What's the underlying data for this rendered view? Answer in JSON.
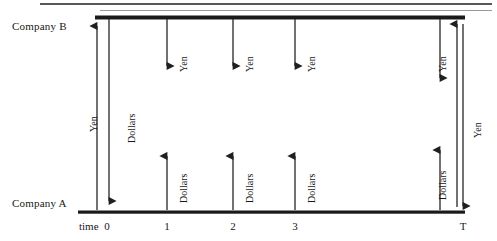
{
  "diagram": {
    "type": "swap-cash-flow-timeline",
    "companies": {
      "top_label": "Company B",
      "bottom_label": "Company A"
    },
    "axis": {
      "time_word": "time",
      "ticks": [
        "0",
        "1",
        "2",
        "3",
        "T"
      ]
    },
    "currencies": {
      "yen": "Yen",
      "dollars": "Dollars"
    },
    "flows": [
      {
        "time": "0",
        "label": "Yen",
        "direction": "up",
        "note": "principal exchange at inception, A to B"
      },
      {
        "time": "0",
        "label": "Dollars",
        "direction": "down",
        "note": "principal exchange at inception, B to A"
      },
      {
        "time": "1",
        "label": "Yen",
        "direction": "down",
        "note": "interest payment B to A"
      },
      {
        "time": "1",
        "label": "Dollars",
        "direction": "up",
        "note": "interest payment A to B"
      },
      {
        "time": "2",
        "label": "Yen",
        "direction": "down",
        "note": "interest payment B to A"
      },
      {
        "time": "2",
        "label": "Dollars",
        "direction": "up",
        "note": "interest payment A to B"
      },
      {
        "time": "3",
        "label": "Yen",
        "direction": "down",
        "note": "interest payment B to A"
      },
      {
        "time": "3",
        "label": "Dollars",
        "direction": "up",
        "note": "interest payment A to B"
      },
      {
        "time": "T",
        "label": "Yen",
        "direction": "down",
        "note": "final interest payment B to A"
      },
      {
        "time": "T",
        "label": "Dollars",
        "direction": "up",
        "note": "final interest payment A to B"
      },
      {
        "time": "T",
        "label": "Yen",
        "direction": "both",
        "note": "principal re-exchange at maturity"
      }
    ],
    "colors": {
      "line": "#262626",
      "rail": "#1a1a1a",
      "rule": "#585858",
      "text": "#171717",
      "background": "#ffffff"
    }
  }
}
